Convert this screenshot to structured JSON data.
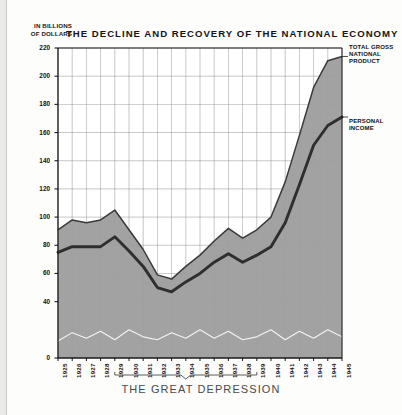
{
  "header": {
    "title": "THE DECLINE AND RECOVERY OF THE NATIONAL ECONOMY",
    "y_axis_caption_line1": "IN BILLIONS",
    "y_axis_caption_line2": "OF DOLLARS"
  },
  "legend": {
    "gnp": "TOTAL GROSS NATIONAL PRODUCT",
    "gnp_line1": "TOTAL GROSS",
    "gnp_line2": "NATIONAL",
    "gnp_line3": "PRODUCT",
    "personal_income": "PERSONAL INCOME",
    "pi_line1": "PERSONAL",
    "pi_line2": "INCOME"
  },
  "annotations": {
    "depression_bracket": "THE GREAT DEPRESSION",
    "depression_start_year": "1929",
    "depression_end_year": "1939"
  },
  "colors": {
    "area_fill": "#9d9d9d",
    "gnp_line": "#3a3a3a",
    "income_line": "#2e2e2e",
    "grid": "#8a8a8a",
    "axis": "#1a1a1a",
    "white_line": "#f4f4f4",
    "caption": "#4a4a4a"
  },
  "chart_data": {
    "type": "area",
    "title": "THE DECLINE AND RECOVERY OF THE NATIONAL ECONOMY",
    "xlabel": "",
    "ylabel": "IN BILLIONS OF DOLLARS",
    "ylim": [
      0,
      220
    ],
    "yticks": [
      0,
      40,
      60,
      80,
      100,
      120,
      140,
      160,
      180,
      200,
      220
    ],
    "ytick_labels": [
      "0",
      "40",
      "60",
      "80",
      "100",
      "120",
      "140",
      "160",
      "180",
      "200",
      "220"
    ],
    "grid": true,
    "legend_position": "right",
    "categories": [
      "1925",
      "1926",
      "1927",
      "1928",
      "1929",
      "1930",
      "1931",
      "1932",
      "1933",
      "1934",
      "1935",
      "1936",
      "1937",
      "1938",
      "1939",
      "1940",
      "1941",
      "1942",
      "1943",
      "1944",
      "1945"
    ],
    "series": [
      {
        "name": "TOTAL GROSS NATIONAL PRODUCT",
        "type": "area",
        "values": [
          91,
          98,
          96,
          98,
          105,
          91,
          77,
          59,
          56,
          65,
          73,
          83,
          92,
          85,
          91,
          100,
          125,
          158,
          192,
          211,
          214
        ]
      },
      {
        "name": "PERSONAL INCOME",
        "type": "line",
        "values": [
          75,
          79,
          79,
          79,
          86,
          76,
          65,
          50,
          47,
          54,
          60,
          68,
          74,
          68,
          73,
          79,
          96,
          123,
          151,
          165,
          171
        ]
      },
      {
        "name": "baseline-variation",
        "type": "line",
        "values": [
          12,
          18,
          14,
          19,
          13,
          20,
          15,
          13,
          18,
          14,
          20,
          14,
          19,
          13,
          15,
          20,
          13,
          19,
          14,
          20,
          15
        ]
      }
    ]
  }
}
